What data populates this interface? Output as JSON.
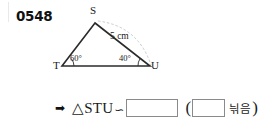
{
  "problem": {
    "number": "0548"
  },
  "figure": {
    "vertices": [
      {
        "name": "S",
        "label": "S"
      },
      {
        "name": "T",
        "label": "T"
      },
      {
        "name": "U",
        "label": "U"
      }
    ],
    "angles": [
      {
        "at": "T",
        "label": "60°"
      },
      {
        "at": "U",
        "label": "40°"
      }
    ],
    "lengths": [
      {
        "side": "SU",
        "label": "5 cm"
      }
    ]
  },
  "answer": {
    "arrow_icon": "➡",
    "triangle_symbol": "△",
    "triangle_name": "STU",
    "similar_symbol": "∽",
    "blank_triangle_value": "",
    "paren_open": "(",
    "blank_condition_value": "",
    "similarity_word": "늮음",
    "paren_close": ")"
  }
}
